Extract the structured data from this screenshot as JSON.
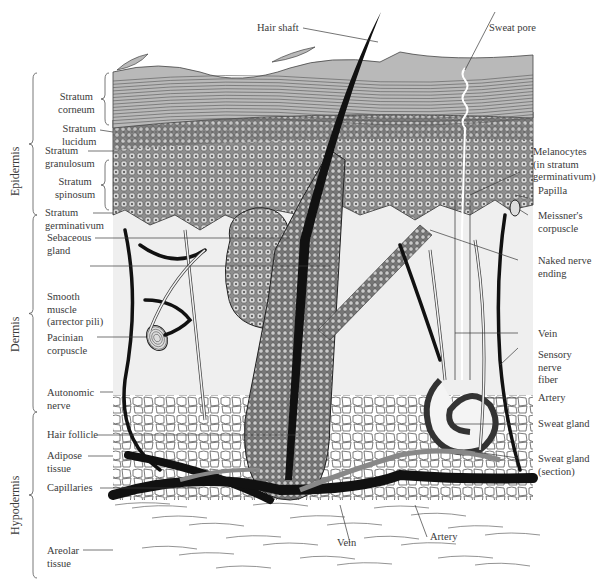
{
  "regions": [
    {
      "id": "epidermis",
      "label": "Epidermis"
    },
    {
      "id": "dermis",
      "label": "Dermis"
    },
    {
      "id": "hypodermis",
      "label": "Hypodermis"
    }
  ],
  "left_labels": [
    {
      "id": "stratum-corneum",
      "lines": [
        "Stratum",
        "corneum"
      ]
    },
    {
      "id": "stratum-lucidum",
      "lines": [
        "Stratum",
        "lucidum"
      ]
    },
    {
      "id": "stratum-granulosum",
      "lines": [
        "Stratum",
        "granulosum"
      ]
    },
    {
      "id": "stratum-spinosum",
      "lines": [
        "Stratum",
        "spinosum"
      ]
    },
    {
      "id": "stratum-germinativum",
      "lines": [
        "Stratum",
        "germinativum"
      ]
    },
    {
      "id": "sebaceous-gland",
      "lines": [
        "Sebaceous",
        "gland"
      ]
    },
    {
      "id": "smooth-muscle",
      "lines": [
        "Smooth",
        "muscle",
        "(arrector pili)"
      ]
    },
    {
      "id": "pacinian-corpuscle",
      "lines": [
        "Pacinian",
        "corpuscle"
      ]
    },
    {
      "id": "autonomic-nerve",
      "lines": [
        "Autonomic",
        "nerve"
      ]
    },
    {
      "id": "hair-follicle",
      "lines": [
        "Hair follicle"
      ]
    },
    {
      "id": "adipose-tissue",
      "lines": [
        "Adipose",
        "tissue"
      ]
    },
    {
      "id": "capillaries",
      "lines": [
        "Capillaries"
      ]
    },
    {
      "id": "areolar-tissue",
      "lines": [
        "Areolar",
        "tissue"
      ]
    }
  ],
  "right_labels": [
    {
      "id": "sweat-pore",
      "lines": [
        "Sweat pore"
      ]
    },
    {
      "id": "melanocytes",
      "lines": [
        "Melanocytes",
        "(in stratum",
        "germinativum)"
      ]
    },
    {
      "id": "papilla",
      "lines": [
        "Papilla"
      ]
    },
    {
      "id": "meissners-corpuscle",
      "lines": [
        "Meissner's",
        "corpuscle"
      ]
    },
    {
      "id": "naked-nerve-ending",
      "lines": [
        "Naked nerve",
        "ending"
      ]
    },
    {
      "id": "vein-right",
      "lines": [
        "Vein"
      ]
    },
    {
      "id": "sensory-nerve-fiber",
      "lines": [
        "Sensory",
        "nerve",
        "fiber"
      ]
    },
    {
      "id": "artery-right",
      "lines": [
        "Artery"
      ]
    },
    {
      "id": "sweat-gland",
      "lines": [
        "Sweat gland"
      ]
    },
    {
      "id": "sweat-gland-section",
      "lines": [
        "Sweat gland",
        "(section)"
      ]
    }
  ],
  "top_labels": [
    {
      "id": "hair-shaft",
      "lines": [
        "Hair shaft"
      ]
    }
  ],
  "bottom_labels": [
    {
      "id": "vein-bottom",
      "lines": [
        "Vein"
      ]
    },
    {
      "id": "artery-bottom",
      "lines": [
        "Artery"
      ]
    }
  ],
  "colors": {
    "corneum": "#b9b9b9",
    "cell_layer": "#9a9a9a",
    "dermis": "#efefef",
    "vessel": "#111111",
    "line": "#3a3a3a"
  }
}
